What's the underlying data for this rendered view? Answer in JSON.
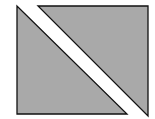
{
  "diagram": {
    "colors": {
      "background": "#ffffff",
      "fill": "#a9a9a9",
      "stroke": "#111111"
    },
    "shapes": [
      {
        "name": "lower-left-triangle",
        "points": "17,6 17,114 127,114"
      },
      {
        "name": "upper-right-triangle",
        "points": "38,6 148,6 148,116"
      }
    ]
  }
}
